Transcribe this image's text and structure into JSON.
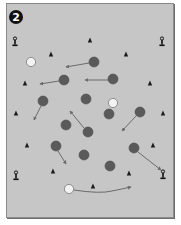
{
  "diagram": {
    "badge_number": "2",
    "colors": {
      "field": "#c6c6c6",
      "border": "#8a8a8a",
      "dark_player": "#5a5a5a",
      "white_player": "#f2f2f2",
      "arrow": "#6b6b6b",
      "cone": "#1a1a1a"
    },
    "poles": [
      {
        "x": 15,
        "y": 42
      },
      {
        "x": 162,
        "y": 42
      },
      {
        "x": 16,
        "y": 176
      },
      {
        "x": 163,
        "y": 175
      }
    ],
    "cones": [
      {
        "x": 90,
        "y": 40
      },
      {
        "x": 51,
        "y": 54
      },
      {
        "x": 126,
        "y": 54
      },
      {
        "x": 25,
        "y": 83
      },
      {
        "x": 150,
        "y": 83
      },
      {
        "x": 16,
        "y": 113
      },
      {
        "x": 163,
        "y": 113
      },
      {
        "x": 27,
        "y": 145
      },
      {
        "x": 153,
        "y": 145
      },
      {
        "x": 53,
        "y": 171
      },
      {
        "x": 129,
        "y": 173
      },
      {
        "x": 93,
        "y": 186
      }
    ],
    "white_players": [
      {
        "x": 31,
        "y": 62
      },
      {
        "x": 113,
        "y": 103
      },
      {
        "x": 69,
        "y": 189
      }
    ],
    "dark_players": [
      {
        "x": 94,
        "y": 62
      },
      {
        "x": 64,
        "y": 80
      },
      {
        "x": 113,
        "y": 79
      },
      {
        "x": 43,
        "y": 101
      },
      {
        "x": 86,
        "y": 99
      },
      {
        "x": 109,
        "y": 114
      },
      {
        "x": 140,
        "y": 112
      },
      {
        "x": 66,
        "y": 125
      },
      {
        "x": 88,
        "y": 132
      },
      {
        "x": 56,
        "y": 146
      },
      {
        "x": 84,
        "y": 155
      },
      {
        "x": 134,
        "y": 148
      },
      {
        "x": 110,
        "y": 166
      }
    ],
    "arrows": [
      {
        "x1": 89,
        "y1": 63,
        "x2": 66,
        "y2": 67
      },
      {
        "x1": 59,
        "y1": 81,
        "x2": 40,
        "y2": 84
      },
      {
        "x1": 108,
        "y1": 80,
        "x2": 85,
        "y2": 80
      },
      {
        "x1": 41,
        "y1": 106,
        "x2": 34,
        "y2": 120
      },
      {
        "x1": 84,
        "y1": 128,
        "x2": 70,
        "y2": 111
      },
      {
        "x1": 136,
        "y1": 116,
        "x2": 122,
        "y2": 131
      },
      {
        "x1": 58,
        "y1": 151,
        "x2": 66,
        "y2": 164
      },
      {
        "x1": 138,
        "y1": 152,
        "x2": 161,
        "y2": 170
      }
    ],
    "curved_arrow": {
      "d": "M74 190 Q100 194 112 191 Q122 189 131 187",
      "x2": 131,
      "y2": 187
    }
  }
}
